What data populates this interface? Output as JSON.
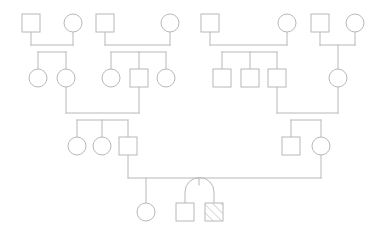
{
  "diagram": {
    "type": "genogram",
    "background_color": "#ffffff",
    "stroke_color": "#b8b8b8",
    "stroke_width": 1,
    "shape_fill": "#ffffff",
    "node_size": 18,
    "circle_radius": 9,
    "canvas": {
      "width": 383,
      "height": 237
    },
    "legend": {
      "square_meaning": "male",
      "circle_meaning": "female",
      "hatched_meaning": "affected-individual",
      "arc_meaning": "monozygotic-twins"
    }
  },
  "nodes": [
    {
      "id": "g1-f1-father",
      "sex": "male",
      "shape": "square",
      "generation": 1,
      "x": 31,
      "y": 23,
      "affected": false
    },
    {
      "id": "g1-f1-mother",
      "sex": "female",
      "shape": "circle",
      "generation": 1,
      "x": 73,
      "y": 23,
      "affected": false
    },
    {
      "id": "g1-f2-father",
      "sex": "male",
      "shape": "square",
      "generation": 1,
      "x": 105,
      "y": 23,
      "affected": false
    },
    {
      "id": "g1-f2-mother",
      "sex": "female",
      "shape": "circle",
      "generation": 1,
      "x": 170,
      "y": 23,
      "affected": false
    },
    {
      "id": "g1-f3-father",
      "sex": "male",
      "shape": "square",
      "generation": 1,
      "x": 210,
      "y": 23,
      "affected": false
    },
    {
      "id": "g1-f3-mother",
      "sex": "female",
      "shape": "circle",
      "generation": 1,
      "x": 287,
      "y": 23,
      "affected": false
    },
    {
      "id": "g1-f4-father",
      "sex": "male",
      "shape": "square",
      "generation": 1,
      "x": 320,
      "y": 23,
      "affected": false
    },
    {
      "id": "g1-f4-mother",
      "sex": "female",
      "shape": "circle",
      "generation": 1,
      "x": 355,
      "y": 23,
      "affected": false
    },
    {
      "id": "g2-a1",
      "sex": "female",
      "shape": "circle",
      "generation": 2,
      "x": 38,
      "y": 78,
      "affected": false
    },
    {
      "id": "g2-a2",
      "sex": "female",
      "shape": "circle",
      "generation": 2,
      "x": 66,
      "y": 78,
      "affected": false
    },
    {
      "id": "g2-b1",
      "sex": "female",
      "shape": "circle",
      "generation": 2,
      "x": 111,
      "y": 78,
      "affected": false
    },
    {
      "id": "g2-b2",
      "sex": "male",
      "shape": "square",
      "generation": 2,
      "x": 139,
      "y": 78,
      "affected": false
    },
    {
      "id": "g2-b3",
      "sex": "female",
      "shape": "circle",
      "generation": 2,
      "x": 166,
      "y": 78,
      "affected": false
    },
    {
      "id": "g2-c1",
      "sex": "male",
      "shape": "square",
      "generation": 2,
      "x": 222,
      "y": 78,
      "affected": false
    },
    {
      "id": "g2-c2",
      "sex": "male",
      "shape": "square",
      "generation": 2,
      "x": 250,
      "y": 78,
      "affected": false
    },
    {
      "id": "g2-c3",
      "sex": "male",
      "shape": "square",
      "generation": 2,
      "x": 277,
      "y": 78,
      "affected": false
    },
    {
      "id": "g2-d1",
      "sex": "female",
      "shape": "circle",
      "generation": 2,
      "x": 338,
      "y": 78,
      "affected": false
    },
    {
      "id": "g3-a1",
      "sex": "female",
      "shape": "circle",
      "generation": 3,
      "x": 77,
      "y": 146,
      "affected": false
    },
    {
      "id": "g3-a2",
      "sex": "female",
      "shape": "circle",
      "generation": 3,
      "x": 102,
      "y": 146,
      "affected": false
    },
    {
      "id": "g3-a3",
      "sex": "male",
      "shape": "square",
      "generation": 3,
      "x": 128,
      "y": 146,
      "affected": false
    },
    {
      "id": "g3-b1",
      "sex": "male",
      "shape": "square",
      "generation": 3,
      "x": 291,
      "y": 146,
      "affected": false
    },
    {
      "id": "g3-b2",
      "sex": "female",
      "shape": "circle",
      "generation": 3,
      "x": 321,
      "y": 146,
      "affected": false
    },
    {
      "id": "g4-child1",
      "sex": "female",
      "shape": "circle",
      "generation": 4,
      "x": 146,
      "y": 212,
      "affected": false
    },
    {
      "id": "g4-twin1",
      "sex": "male",
      "shape": "square",
      "generation": 4,
      "x": 185,
      "y": 212,
      "affected": false
    },
    {
      "id": "g4-twin2",
      "sex": "male",
      "shape": "square",
      "generation": 4,
      "x": 214,
      "y": 212,
      "affected": true
    }
  ],
  "unions": [
    {
      "id": "union-1",
      "partners": [
        "g1-f1-father",
        "g1-f1-mother"
      ],
      "children": [
        "g2-a1",
        "g2-a2"
      ]
    },
    {
      "id": "union-2",
      "partners": [
        "g1-f2-father",
        "g1-f2-mother"
      ],
      "children": [
        "g2-b1",
        "g2-b2",
        "g2-b3"
      ]
    },
    {
      "id": "union-3",
      "partners": [
        "g1-f3-father",
        "g1-f3-mother"
      ],
      "children": [
        "g2-c1",
        "g2-c2",
        "g2-c3"
      ]
    },
    {
      "id": "union-4",
      "partners": [
        "g1-f4-father",
        "g1-f4-mother"
      ],
      "children": [
        "g2-d1"
      ]
    },
    {
      "id": "union-5",
      "partners": [
        "g2-a2",
        "g2-b2"
      ],
      "children": [
        "g3-a1",
        "g3-a2",
        "g3-a3"
      ]
    },
    {
      "id": "union-6",
      "partners": [
        "g2-c3",
        "g2-d1"
      ],
      "children": [
        "g3-b1",
        "g3-b2"
      ]
    },
    {
      "id": "union-7",
      "partners": [
        "g3-a3",
        "g3-b2"
      ],
      "children": [
        "g4-child1",
        "g4-twin1",
        "g4-twin2"
      ],
      "twin_pair": [
        "g4-twin1",
        "g4-twin2"
      ],
      "twin_type": "monozygotic"
    }
  ]
}
